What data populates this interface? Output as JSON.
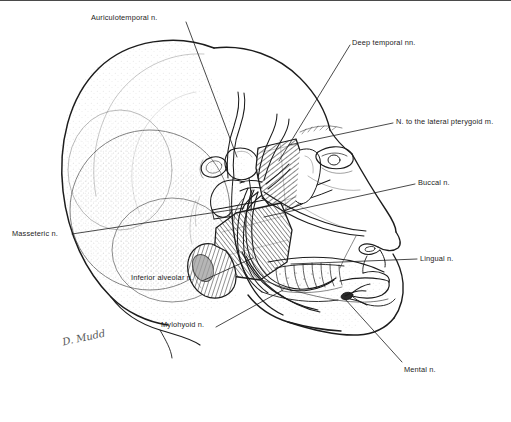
{
  "figure": {
    "type": "anatomical-line-illustration",
    "background_color": "#ffffff",
    "ink_color": "#1c1c1c",
    "border": {
      "position": "top",
      "color": "#4a4a4a",
      "thickness_px": 1
    },
    "signature": "D. Mudd",
    "label_count": 9
  },
  "labels": [
    {
      "id": "auriculotemporal",
      "text": "Auriculotemporal n.",
      "x": 91,
      "y": 13,
      "align": "left",
      "leader": {
        "x1": 186,
        "y1": 22,
        "x2": 237,
        "y2": 157
      }
    },
    {
      "id": "deep-temporal",
      "text": "Deep temporal nn.",
      "x": 352,
      "y": 38,
      "align": "left",
      "leader": {
        "x1": 350,
        "y1": 45,
        "x2": 279,
        "y2": 161
      }
    },
    {
      "id": "lateral-pterygoid",
      "text": "N. to the lateral pterygoid m.",
      "x": 396,
      "y": 117,
      "align": "left",
      "leader": {
        "x1": 393,
        "y1": 123,
        "x2": 289,
        "y2": 145
      }
    },
    {
      "id": "buccal",
      "text": "Buccal n.",
      "x": 418,
      "y": 178,
      "align": "left",
      "leader": {
        "x1": 415,
        "y1": 184,
        "x2": 264,
        "y2": 217
      }
    },
    {
      "id": "masseteric",
      "text": "Masseteric n.",
      "x": 12,
      "y": 229,
      "align": "left",
      "leader": {
        "x1": 72,
        "y1": 234,
        "x2": 244,
        "y2": 208
      }
    },
    {
      "id": "lingual",
      "text": "Lingual n.",
      "x": 420,
      "y": 254,
      "align": "left",
      "leader": {
        "x1": 417,
        "y1": 259,
        "x2": 291,
        "y2": 264
      }
    },
    {
      "id": "inferior-alveolar",
      "text": "Inferior alveolar n.",
      "x": 131,
      "y": 273,
      "align": "left",
      "leader": {
        "x1": 202,
        "y1": 281,
        "x2": 253,
        "y2": 258
      }
    },
    {
      "id": "mylohyoid",
      "text": "Mylohyoid n.",
      "x": 161,
      "y": 320,
      "align": "left",
      "leader": {
        "x1": 216,
        "y1": 327,
        "x2": 283,
        "y2": 290
      }
    },
    {
      "id": "mental",
      "text": "Mental n.",
      "x": 404,
      "y": 365,
      "align": "left",
      "leader": {
        "x1": 402,
        "y1": 365,
        "x2": 344,
        "y2": 318
      }
    }
  ],
  "anatomy": {
    "structures": [
      "cranium",
      "temporal-fossa",
      "zygomatic-arch",
      "external-ear-canal",
      "mandibular-condyle",
      "lateral-pterygoid-muscle",
      "medial-pterygoid-muscle",
      "mandible",
      "mandibular-teeth-roots",
      "mental-foramen",
      "orbit-and-eye",
      "nose",
      "lips",
      "chin"
    ]
  }
}
